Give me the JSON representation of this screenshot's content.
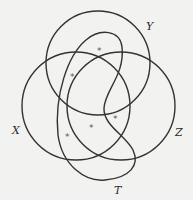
{
  "diagram": {
    "type": "venn",
    "sets": [
      {
        "name": "Y",
        "label": "Y",
        "shape": "circle",
        "cx": 98,
        "cy": 63,
        "r": 52,
        "label_x": 146,
        "label_y": 30
      },
      {
        "name": "X",
        "label": "X",
        "shape": "circle",
        "cx": 76,
        "cy": 106,
        "r": 54,
        "label_x": 12,
        "label_y": 134
      },
      {
        "name": "Z",
        "label": "Z",
        "shape": "circle",
        "cx": 121,
        "cy": 106,
        "r": 54,
        "label_x": 175,
        "label_y": 136
      },
      {
        "name": "T",
        "label": "T",
        "shape": "curve",
        "label_x": 114,
        "label_y": 194
      }
    ],
    "markers": [
      {
        "symbol": "*",
        "x": 100,
        "y": 51
      },
      {
        "symbol": "*",
        "x": 73,
        "y": 77
      },
      {
        "symbol": "*",
        "x": 68,
        "y": 137
      },
      {
        "symbol": "*",
        "x": 92,
        "y": 128
      },
      {
        "symbol": "*",
        "x": 116,
        "y": 119
      }
    ],
    "stroke_color": "#333333",
    "background": "#f2f2f0"
  }
}
